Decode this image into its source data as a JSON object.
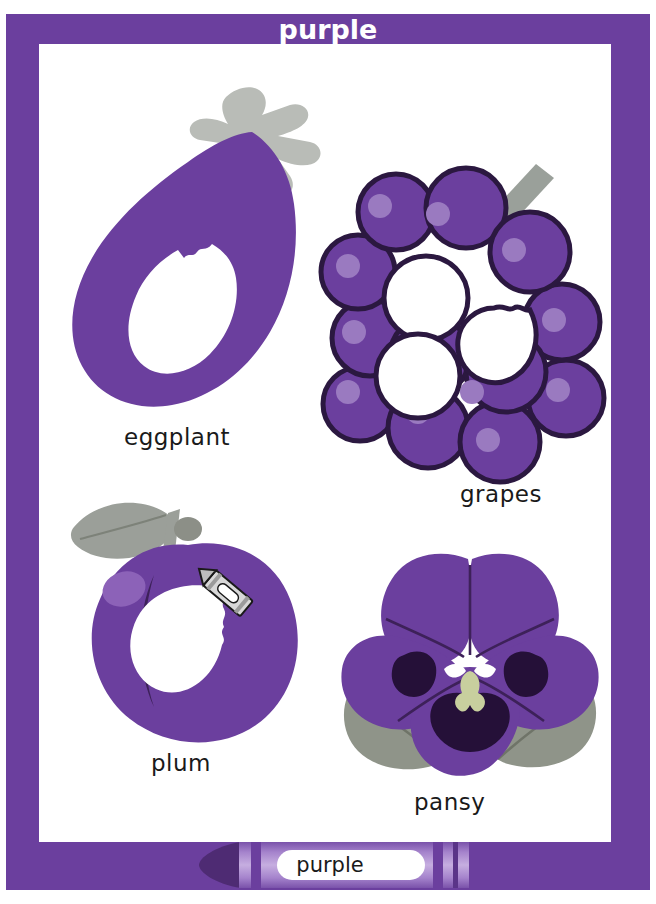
{
  "poster": {
    "title": "purple",
    "frame_color": "#6b3f9e",
    "canvas_color": "#ffffff",
    "title_color": "#ffffff"
  },
  "palette": {
    "purple_main": "#6b3f9e",
    "purple_dark": "#4e2b73",
    "purple_light": "#8c62b8",
    "purple_highlight": "#9a7ac0",
    "gray_green": "#9aa09a",
    "gray_leaf": "#9b9f99",
    "white": "#ffffff",
    "outline": "#2b1840",
    "label_text": "#1a1a1a"
  },
  "items": [
    {
      "id": "eggplant",
      "label": "eggplant",
      "icon": "eggplant-illustration",
      "body_color": "#6b3f9e",
      "stem_color": "#b9bcb7",
      "interior_color": "#ffffff"
    },
    {
      "id": "grapes",
      "label": "grapes",
      "icon": "grapes-illustration",
      "body_color": "#6b3f9e",
      "outline_color": "#2b1840",
      "highlight_color": "#9a7ac0",
      "stem_color": "#9aa09a",
      "interior_color": "#ffffff"
    },
    {
      "id": "plum",
      "label": "plum",
      "icon": "plum-illustration",
      "body_color": "#6b3f9e",
      "leaf_color": "#9b9f99",
      "crease_color": "#3d2159",
      "highlight_color": "#8c62b8",
      "interior_color": "#ffffff"
    },
    {
      "id": "pansy",
      "label": "pansy",
      "icon": "pansy-illustration",
      "petal_color": "#6b3f9e",
      "petal_dark": "#251038",
      "leaf_color": "#8f9489",
      "center_color": "#ffffff",
      "center_accent": "#c8cf9e"
    }
  ],
  "crayon": {
    "label": "purple",
    "tip_color": "#4e2b73",
    "body_color": "#8c62b8",
    "band_color": "#6b3f9e",
    "label_bg": "#ffffff",
    "label_text_color": "#1a1a1a"
  }
}
